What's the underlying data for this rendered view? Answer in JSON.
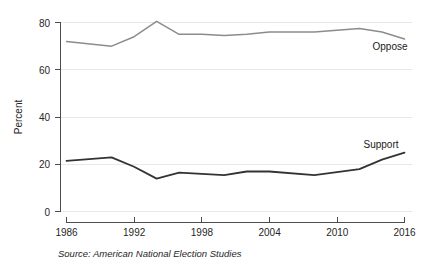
{
  "chart_data": {
    "type": "line",
    "title": "",
    "xlabel": "",
    "ylabel": "Percent",
    "xlim": [
      1986,
      2016
    ],
    "ylim": [
      0,
      80
    ],
    "grid": true,
    "legend_position": "inline-right",
    "x_ticks": [
      "1986",
      "1992",
      "1998",
      "2004",
      "2010",
      "2016"
    ],
    "x_tick_values": [
      1986,
      1992,
      1998,
      2004,
      2010,
      2016
    ],
    "y_ticks": [
      "0",
      "20",
      "40",
      "60",
      "80"
    ],
    "y_tick_values": [
      0,
      20,
      40,
      60,
      80
    ],
    "x": [
      1986,
      1990,
      1992,
      1994,
      1996,
      1998,
      2000,
      2002,
      2004,
      2008,
      2012,
      2014,
      2016
    ],
    "series": [
      {
        "name": "Oppose",
        "color": "#8c8c8c",
        "values": [
          72,
          70,
          74,
          80.5,
          75,
          75,
          74.5,
          75,
          76,
          76,
          77.5,
          76,
          73
        ]
      },
      {
        "name": "Support",
        "color": "#333333",
        "values": [
          21.5,
          23,
          19,
          14,
          16.5,
          16,
          15.5,
          17,
          17,
          15.5,
          18,
          22,
          25
        ]
      }
    ],
    "annotations": [
      {
        "text": "Oppose",
        "x": 2014,
        "y": 68
      },
      {
        "text": "Support",
        "x": 2013,
        "y": 31
      }
    ],
    "source_note": "Source: American National Election Studies"
  },
  "labels": {
    "y_axis_title": "Percent",
    "oppose_series": "Oppose",
    "support_series": "Support",
    "source": "Source: American National Election Studies",
    "y_0": "0",
    "y_20": "20",
    "y_40": "40",
    "y_60": "60",
    "y_80": "80",
    "x_1986": "1986",
    "x_1992": "1992",
    "x_1998": "1998",
    "x_2004": "2004",
    "x_2010": "2010",
    "x_2016": "2016"
  }
}
